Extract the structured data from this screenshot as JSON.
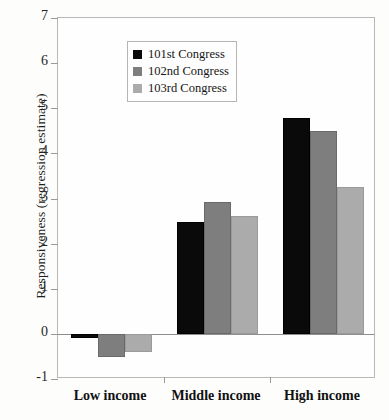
{
  "chart_data": {
    "type": "bar",
    "title": "",
    "subtitle": "",
    "xlabel": "",
    "ylabel": "Responsiveness (regression estimate)",
    "categories": [
      "Low income",
      "Middle income",
      "High income"
    ],
    "series": [
      {
        "name": "101st Congress",
        "color": "#0a0a0a",
        "values": [
          -0.1,
          2.48,
          4.78
        ]
      },
      {
        "name": "102nd Congress",
        "color": "#7e7e7e",
        "values": [
          -0.52,
          2.92,
          4.5
        ]
      },
      {
        "name": "103rd Congress",
        "color": "#ababab",
        "values": [
          -0.4,
          2.62,
          3.25
        ]
      }
    ],
    "ylim": [
      -1,
      7
    ],
    "ytick_labels": [
      "7",
      "6",
      "5",
      "4",
      "3",
      "2",
      "1",
      "0",
      "-1"
    ],
    "ytick_values": [
      7,
      6,
      5,
      4,
      3,
      2,
      1,
      0,
      -1
    ],
    "grid": false,
    "legend_position": "top-left",
    "zero_line": true
  },
  "legend": {
    "items": [
      {
        "label": "101st Congress",
        "swatch": "black-swatch"
      },
      {
        "label": "102nd Congress",
        "swatch": "medium-gray-swatch"
      },
      {
        "label": "103rd Congress",
        "swatch": "light-gray-swatch"
      }
    ]
  }
}
